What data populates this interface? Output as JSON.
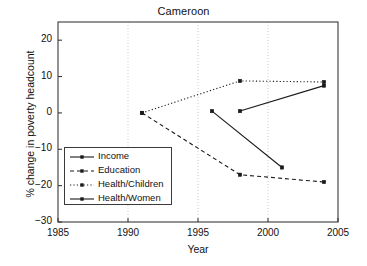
{
  "chart_data": {
    "type": "line",
    "title": "Cameroon",
    "xlabel": "Year",
    "ylabel": "% change in poverty headcount",
    "xlim": [
      1985,
      2005
    ],
    "ylim": [
      -30,
      25
    ],
    "xticks": [
      1985,
      1990,
      1995,
      2000,
      2005
    ],
    "yticks": [
      20,
      10,
      0,
      -10,
      -20,
      -30
    ],
    "ytick_labels": [
      "20",
      "10",
      "0",
      "−10",
      "−20",
      "−30"
    ],
    "xtick_labels": [
      "1985",
      "1990",
      "1995",
      "2000",
      "2005"
    ],
    "grid": "vertical-dotted",
    "legend_position": "lower-left",
    "series": [
      {
        "name": "Income",
        "style": "solid",
        "marker": "square",
        "x": [
          1998,
          2004
        ],
        "values": [
          0.5,
          7.5
        ]
      },
      {
        "name": "Education",
        "style": "dashed",
        "marker": "square",
        "x": [
          1991,
          1998,
          2004
        ],
        "values": [
          0,
          -17,
          -19
        ]
      },
      {
        "name": "Health/Children",
        "style": "dotted",
        "marker": "square",
        "x": [
          1991,
          1998,
          2004
        ],
        "values": [
          0,
          8.8,
          8.5
        ]
      },
      {
        "name": "Health/Women",
        "style": "solid",
        "marker": "square",
        "x": [
          1996,
          2001
        ],
        "values": [
          0.5,
          -15
        ]
      }
    ]
  },
  "colors": {
    "line": "#1a1a1a",
    "axis": "#3a3a3a",
    "grid": "#cccccc",
    "background": "#ffffff"
  }
}
